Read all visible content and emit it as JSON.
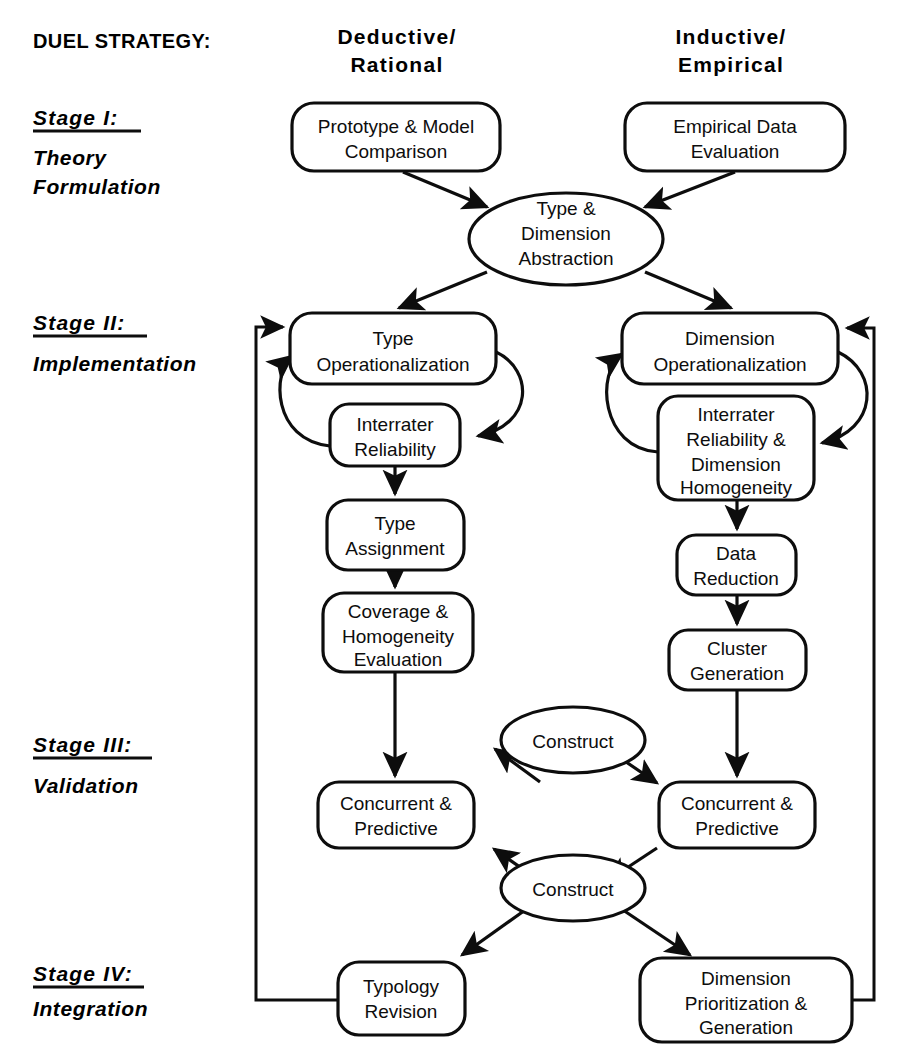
{
  "diagram": {
    "title_label": "DUEL STRATEGY:",
    "columns": [
      {
        "line1": "Deductive/",
        "line2": "Rational"
      },
      {
        "line1": "Inductive/",
        "line2": "Empirical"
      }
    ],
    "stages": [
      {
        "name": "Stage I:",
        "sub": "Theory Formulation",
        "sub_line1": "Theory",
        "sub_line2": "Formulation"
      },
      {
        "name": "Stage II:",
        "sub": "Implementation",
        "sub_line1": "Implementation",
        "sub_line2": ""
      },
      {
        "name": "Stage III:",
        "sub": "Validation",
        "sub_line1": "Validation",
        "sub_line2": ""
      },
      {
        "name": "Stage IV:",
        "sub": "Integration",
        "sub_line1": "Integration",
        "sub_line2": ""
      }
    ],
    "nodes": {
      "prototype": {
        "shape": "rounded-rect",
        "lines": [
          "Prototype & Model",
          "Comparison"
        ]
      },
      "empirical": {
        "shape": "rounded-rect",
        "lines": [
          "Empirical  Data",
          "Evaluation"
        ]
      },
      "abstraction": {
        "shape": "ellipse",
        "lines": [
          "Type &",
          "Dimension",
          "Abstraction"
        ]
      },
      "type_oper": {
        "shape": "rounded-rect",
        "lines": [
          "Type",
          "Operationalization"
        ]
      },
      "dim_oper": {
        "shape": "rounded-rect",
        "lines": [
          "Dimension",
          "Operationalization"
        ]
      },
      "interrater_l": {
        "shape": "rounded-rect",
        "lines": [
          "Interrater",
          "Reliability"
        ]
      },
      "interrater_r": {
        "shape": "rounded-rect",
        "lines": [
          "Interrater",
          "Reliability  &",
          "Dimension",
          "Homogeneity"
        ]
      },
      "type_assign": {
        "shape": "rounded-rect",
        "lines": [
          "Type",
          "Assignment"
        ]
      },
      "data_reduction": {
        "shape": "rounded-rect",
        "lines": [
          "Data",
          "Reduction"
        ]
      },
      "coverage": {
        "shape": "rounded-rect",
        "lines": [
          "Coverage &",
          "Homogeneity",
          "Evaluation"
        ]
      },
      "cluster": {
        "shape": "rounded-rect",
        "lines": [
          "Cluster",
          "Generation"
        ]
      },
      "construct_top": {
        "shape": "ellipse",
        "lines": [
          "Construct"
        ]
      },
      "construct_bot": {
        "shape": "ellipse",
        "lines": [
          "Construct"
        ]
      },
      "conc_pred_l": {
        "shape": "rounded-rect",
        "lines": [
          "Concurrent &",
          "Predictive"
        ]
      },
      "conc_pred_r": {
        "shape": "rounded-rect",
        "lines": [
          "Concurrent &",
          "Predictive"
        ]
      },
      "typology": {
        "shape": "rounded-rect",
        "lines": [
          "Typology",
          "Revision"
        ]
      },
      "dim_prior": {
        "shape": "rounded-rect",
        "lines": [
          "Dimension",
          "Prioritization  &",
          "Generation"
        ]
      }
    },
    "colors": {
      "stroke": "#0d0d0d",
      "fill": "#ffffff",
      "text": "#0d0d0d"
    }
  }
}
